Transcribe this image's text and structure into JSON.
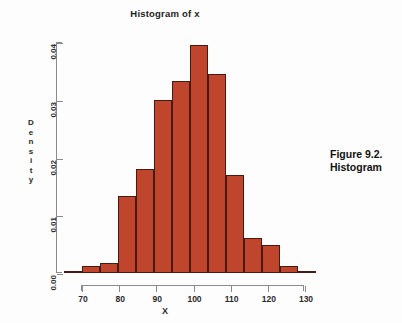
{
  "figure": {
    "caption_line1": "Figure 9.2.",
    "caption_line2": "Histogram"
  },
  "chart_data": {
    "type": "bar",
    "title": "Histogram of x",
    "xlabel": "X",
    "ylabel": "Density",
    "ylabel_letters": [
      "D",
      "e",
      "n",
      "s",
      "i",
      "t",
      "y"
    ],
    "xlim": [
      65,
      135
    ],
    "ylim": [
      0.0,
      0.04
    ],
    "grid": false,
    "legend": "none",
    "bin_width": 5,
    "bin_edges": [
      65,
      70,
      75,
      80,
      85,
      90,
      95,
      100,
      105,
      110,
      115,
      120,
      125,
      130,
      135
    ],
    "categories": [
      "65-70",
      "70-75",
      "75-80",
      "80-85",
      "85-90",
      "90-95",
      "95-100",
      "100-105",
      "105-110",
      "110-115",
      "115-120",
      "120-125",
      "125-130",
      "130-135"
    ],
    "bin_centers": [
      67.5,
      72.5,
      77.5,
      82.5,
      87.5,
      92.5,
      97.5,
      102.5,
      107.5,
      112.5,
      117.5,
      122.5,
      127.5,
      132.5
    ],
    "values": [
      0.0002,
      0.0013,
      0.0018,
      0.0133,
      0.018,
      0.03,
      0.0333,
      0.0394,
      0.0345,
      0.017,
      0.006,
      0.0048,
      0.0013,
      0.0002
    ],
    "yticks": [
      0.04,
      0.03,
      0.02,
      0.01,
      0.0
    ],
    "ytick_labels": [
      "0.04",
      "0.03",
      "0.02",
      "0.01",
      "0.00"
    ],
    "xticks": [
      70,
      80,
      90,
      100,
      110,
      120,
      130
    ],
    "xtick_labels": [
      "70",
      "80",
      "90",
      "100",
      "110",
      "120",
      "130"
    ],
    "bar_color": "#c0452d",
    "bar_border_color": "#4a1a12",
    "axis_color": "#8b8b8b"
  }
}
